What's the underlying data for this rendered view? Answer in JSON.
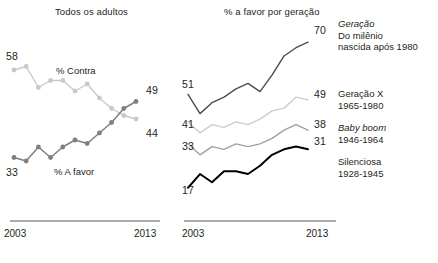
{
  "panels": {
    "left": {
      "title": "Todos os adultos",
      "axis": {
        "start": "2003",
        "end": "2013"
      },
      "series": [
        {
          "name": "% Contra",
          "label": "% Contra",
          "color": "#c9c9c9",
          "start_value": 58,
          "end_value": 44,
          "start_label": "58",
          "end_label": "44"
        },
        {
          "name": "% A favor",
          "label": "% A favor",
          "color": "#7f7f7f",
          "start_value": 33,
          "end_value": 49,
          "start_label": "33",
          "end_label": "49"
        }
      ]
    },
    "right": {
      "title": "% a favor por geração",
      "axis": {
        "start": "2003",
        "end": "2013"
      },
      "legend": [
        {
          "line1": "Geração",
          "line1_italic": true,
          "line2": "Do milênio",
          "line3": "nascida após 1980"
        },
        {
          "line1": "Geração X",
          "line1_italic": false,
          "line2": "1965-1980",
          "line3": ""
        },
        {
          "line1": "Baby boom",
          "line1_italic": true,
          "line2": "1946-1964",
          "line3": ""
        },
        {
          "line1": "Silenciosa",
          "line1_italic": false,
          "line2": "1928-1945",
          "line3": ""
        }
      ]
    }
  },
  "chart_data": [
    {
      "type": "line",
      "title": "Todos os adultos",
      "xlabel": "",
      "ylabel": "",
      "x": [
        2003,
        2004,
        2005,
        2006,
        2007,
        2008,
        2009,
        2010,
        2011,
        2012,
        2013
      ],
      "xlim": [
        2003,
        2013
      ],
      "ylim": [
        28,
        62
      ],
      "grid": false,
      "legend": "inline-annotations",
      "markers": true,
      "series": [
        {
          "name": "% Contra",
          "color": "#c9c9c9",
          "values": [
            58,
            59,
            53,
            55,
            55,
            52,
            54,
            50,
            47,
            45,
            44
          ],
          "endpoint_labels": {
            "first": 58,
            "last": 44
          }
        },
        {
          "name": "% A favor",
          "color": "#7f7f7f",
          "values": [
            33,
            32,
            36,
            33,
            36,
            38,
            37,
            40,
            43,
            47,
            49
          ],
          "endpoint_labels": {
            "first": 33,
            "last": 49
          }
        }
      ]
    },
    {
      "type": "line",
      "title": "% a favor por geração",
      "xlabel": "",
      "ylabel": "",
      "x": [
        2003,
        2004,
        2005,
        2006,
        2007,
        2008,
        2009,
        2010,
        2011,
        2012,
        2013
      ],
      "xlim": [
        2003,
        2013
      ],
      "ylim": [
        14,
        73
      ],
      "grid": false,
      "legend": "right-side-labels",
      "markers": false,
      "series": [
        {
          "name": "Geração do milênio (nascida após 1980)",
          "color": "#4d4d4d",
          "values": [
            51,
            44,
            48,
            50,
            53,
            55,
            52,
            58,
            65,
            68,
            70
          ],
          "endpoint_labels": {
            "first": 51,
            "last": 70
          }
        },
        {
          "name": "Geração X (1965-1980)",
          "color": "#cccccc",
          "values": [
            41,
            37,
            40,
            39,
            41,
            40,
            42,
            45,
            46,
            50,
            49
          ],
          "endpoint_labels": {
            "first": 41,
            "last": 49
          }
        },
        {
          "name": "Baby boom (1946-1964)",
          "color": "#a0a0a0",
          "values": [
            33,
            29,
            32,
            31,
            33,
            32,
            33,
            35,
            38,
            40,
            38
          ],
          "endpoint_labels": {
            "first": 33,
            "last": 38
          }
        },
        {
          "name": "Silenciosa (1928-1945)",
          "color": "#000000",
          "values": [
            17,
            22,
            19,
            23,
            23,
            22,
            25,
            29,
            31,
            32,
            31
          ],
          "endpoint_labels": {
            "first": 17,
            "last": 31
          }
        }
      ]
    }
  ]
}
